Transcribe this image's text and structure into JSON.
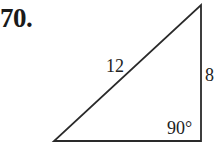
{
  "problem": {
    "number_label": "70."
  },
  "figure": {
    "type": "right-triangle",
    "vertices": {
      "top": [
        201,
        5
      ],
      "bottom_right": [
        201,
        141
      ],
      "bottom_left": [
        54,
        141
      ]
    },
    "hypotenuse_label": "12",
    "vertical_side_label": "8",
    "right_angle_label": "90°",
    "stroke_color": "#2a2a2a",
    "text_color": "#222222"
  }
}
